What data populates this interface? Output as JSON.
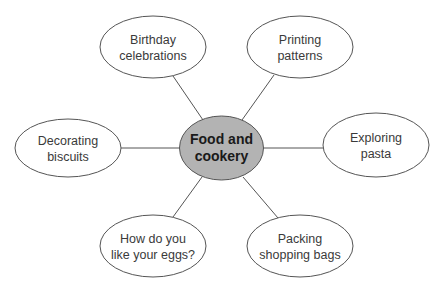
{
  "diagram": {
    "type": "mind-map",
    "center": {
      "lines": [
        "Food and",
        "cookery"
      ],
      "cx": 221.5,
      "cy": 148,
      "rx": 42,
      "ry": 32,
      "fill": "#b3b3b3"
    },
    "stroke_color": "#555555",
    "node_fill": "#ffffff",
    "nodes": [
      {
        "id": "birthday",
        "lines": [
          "Birthday",
          "celebrations"
        ],
        "cx": 153,
        "cy": 47,
        "rx": 53,
        "ry": 31
      },
      {
        "id": "printing",
        "lines": [
          "Printing",
          "patterns"
        ],
        "cx": 300,
        "cy": 47,
        "rx": 53,
        "ry": 31
      },
      {
        "id": "decorating",
        "lines": [
          "Decorating",
          "biscuits"
        ],
        "cx": 68,
        "cy": 148,
        "rx": 53,
        "ry": 29
      },
      {
        "id": "exploring",
        "lines": [
          "Exploring",
          "pasta"
        ],
        "cx": 376,
        "cy": 145,
        "rx": 53,
        "ry": 32
      },
      {
        "id": "eggs",
        "lines": [
          "How do you",
          "like your eggs?"
        ],
        "cx": 153,
        "cy": 246,
        "rx": 53,
        "ry": 31
      },
      {
        "id": "packing",
        "lines": [
          "Packing",
          "shopping bags"
        ],
        "cx": 300,
        "cy": 246,
        "rx": 53,
        "ry": 31
      }
    ],
    "edges": [
      {
        "to": "birthday",
        "x1": 203,
        "y1": 120,
        "x2": 173,
        "y2": 76
      },
      {
        "to": "printing",
        "x1": 242,
        "y1": 120,
        "x2": 274,
        "y2": 75
      },
      {
        "to": "decorating",
        "x1": 180,
        "y1": 148,
        "x2": 121,
        "y2": 148
      },
      {
        "to": "exploring",
        "x1": 263,
        "y1": 148,
        "x2": 323,
        "y2": 148
      },
      {
        "to": "eggs",
        "x1": 202,
        "y1": 177,
        "x2": 173,
        "y2": 217
      },
      {
        "to": "packing",
        "x1": 243,
        "y1": 177,
        "x2": 278,
        "y2": 218
      }
    ]
  }
}
